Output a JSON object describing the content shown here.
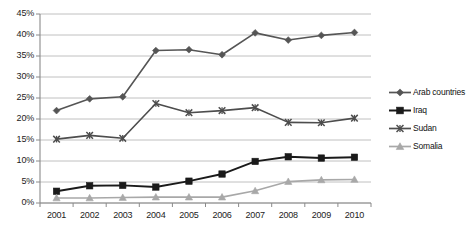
{
  "chart_data": {
    "type": "line",
    "title": "",
    "xlabel": "",
    "ylabel": "",
    "categories": [
      "2001",
      "2002",
      "2003",
      "2004",
      "2005",
      "2006",
      "2007",
      "2008",
      "2009",
      "2010"
    ],
    "ylim": [
      0,
      45
    ],
    "ytick_labels": [
      "0%",
      "5%",
      "10%",
      "15%",
      "20%",
      "25%",
      "30%",
      "35%",
      "40%",
      "45%"
    ],
    "ytick_values": [
      0,
      5,
      10,
      15,
      20,
      25,
      30,
      35,
      40,
      45
    ],
    "grid": true,
    "legend_position": "right",
    "value_suffix": "%",
    "series": [
      {
        "name": "Arab countries",
        "marker": "diamond",
        "color": "#555555",
        "values": [
          22.0,
          24.8,
          25.3,
          36.3,
          36.5,
          35.3,
          40.5,
          38.8,
          39.9,
          40.6
        ]
      },
      {
        "name": "Iraq",
        "marker": "square",
        "color": "#1a1a1a",
        "values": [
          2.8,
          4.1,
          4.2,
          3.8,
          5.2,
          6.9,
          9.9,
          11.0,
          10.7,
          10.9
        ]
      },
      {
        "name": "Sudan",
        "marker": "x",
        "color": "#4d4d4d",
        "values": [
          15.2,
          16.1,
          15.4,
          23.7,
          21.5,
          22.0,
          22.7,
          19.2,
          19.1,
          20.2
        ]
      },
      {
        "name": "Somalia",
        "marker": "triangle",
        "color": "#a8a8a8",
        "values": [
          1.2,
          1.2,
          1.3,
          1.4,
          1.4,
          1.4,
          2.9,
          5.1,
          5.5,
          5.6
        ]
      }
    ]
  },
  "axis": {
    "axis_color": "#8a8a8a",
    "grid_color": "#b9b9b9",
    "tick_text_color": "#1c1c1c"
  }
}
